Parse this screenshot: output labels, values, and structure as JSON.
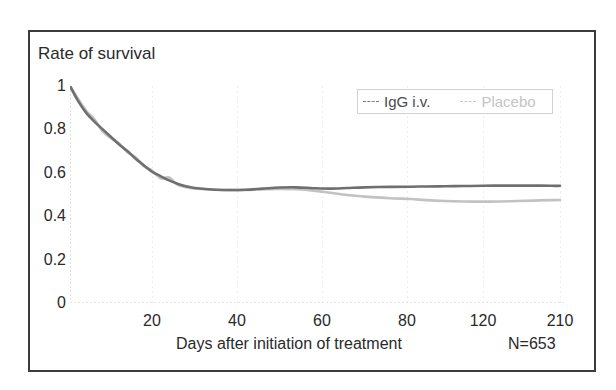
{
  "figure": {
    "border_color": "#3b3b3b",
    "background": "#ffffff"
  },
  "axes": {
    "y_title": "Rate of survival",
    "y_ticks": [
      "1",
      "0.8",
      "0.6",
      "0.4",
      "0.2",
      "0"
    ],
    "x_ticks": [
      "20",
      "40",
      "60",
      "80",
      "120",
      "210"
    ],
    "x_title": "Days after initiation of  treatment",
    "n_label": "N=653"
  },
  "legend": {
    "items": [
      {
        "label": "IgG i.v.",
        "dash": "---",
        "color": "#4a4a4a"
      },
      {
        "label": "Placebo",
        "dash": "---",
        "color": "#c4c4c4"
      }
    ]
  },
  "chart_data": {
    "type": "line",
    "title": "",
    "xlabel": "Days after initiation of  treatment",
    "ylabel": "Rate of survival",
    "annotation": "N=653",
    "grid": true,
    "legend_position": "top-right",
    "xlim": [
      0,
      210
    ],
    "ylim": [
      0,
      1
    ],
    "x_tick_values": [
      20,
      40,
      60,
      80,
      120,
      210
    ],
    "x_tick_positions_px": [
      152,
      237,
      322,
      407,
      483,
      560
    ],
    "y_tick_values": [
      0,
      0.2,
      0.4,
      0.6,
      0.8,
      1
    ],
    "x": [
      0,
      2,
      4,
      6,
      8,
      10,
      12,
      14,
      16,
      18,
      20,
      22,
      24,
      26,
      28,
      30,
      34,
      38,
      42,
      46,
      50,
      54,
      58,
      62,
      66,
      70,
      76,
      82,
      90,
      100,
      110,
      120,
      140,
      160,
      180,
      200,
      210
    ],
    "series": [
      {
        "name": "IgG i.v.",
        "color": "#6f6f6f",
        "values": [
          1.0,
          0.93,
          0.875,
          0.835,
          0.8,
          0.765,
          0.73,
          0.7,
          0.665,
          0.635,
          0.605,
          0.585,
          0.565,
          0.55,
          0.538,
          0.53,
          0.523,
          0.521,
          0.522,
          0.527,
          0.532,
          0.533,
          0.529,
          0.527,
          0.53,
          0.533,
          0.535,
          0.536,
          0.537,
          0.538,
          0.539,
          0.54,
          0.541,
          0.541,
          0.541,
          0.54,
          0.54
        ]
      },
      {
        "name": "Placebo",
        "color": "#c2c2c2",
        "values": [
          1.0,
          0.94,
          0.885,
          0.845,
          0.79,
          0.76,
          0.735,
          0.695,
          0.672,
          0.63,
          0.612,
          0.575,
          0.578,
          0.545,
          0.534,
          0.528,
          0.523,
          0.52,
          0.521,
          0.524,
          0.526,
          0.524,
          0.518,
          0.508,
          0.498,
          0.49,
          0.483,
          0.479,
          0.474,
          0.47,
          0.468,
          0.467,
          0.468,
          0.47,
          0.472,
          0.474,
          0.475
        ]
      }
    ]
  }
}
